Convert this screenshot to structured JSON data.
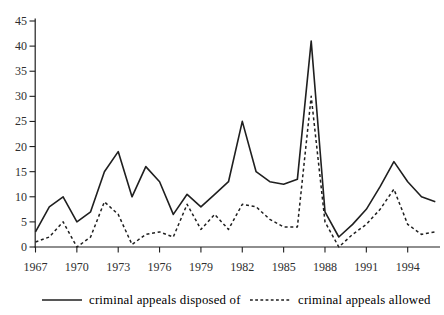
{
  "figure": {
    "background": "#ffffff",
    "ink_color": "#1f1f1f",
    "text_color": "#2e2e2e"
  },
  "chart_data": {
    "type": "line",
    "title": "",
    "xlabel": "",
    "ylabel": "",
    "x": [
      1967,
      1968,
      1969,
      1970,
      1971,
      1972,
      1973,
      1974,
      1975,
      1976,
      1977,
      1978,
      1979,
      1980,
      1981,
      1982,
      1983,
      1984,
      1985,
      1986,
      1987,
      1988,
      1989,
      1990,
      1991,
      1992,
      1993,
      1994,
      1995,
      1996
    ],
    "series": [
      {
        "name": "criminal appeals disposed of",
        "style": "solid",
        "values": [
          3,
          8,
          10,
          5,
          7,
          15,
          19,
          10,
          16,
          13,
          6.5,
          10.5,
          8,
          10.5,
          13,
          25,
          15,
          13,
          12.5,
          13.5,
          41,
          7,
          2,
          4.5,
          7.5,
          12,
          17,
          13,
          10,
          9
        ]
      },
      {
        "name": "criminal appeals allowed",
        "style": "dashed",
        "values": [
          1,
          2,
          5,
          0,
          2,
          9,
          6.5,
          0.5,
          2.5,
          3,
          2,
          8.5,
          3.5,
          6.5,
          3.5,
          8.5,
          8,
          5.5,
          4,
          4,
          30,
          5,
          0,
          2.5,
          4.5,
          7.5,
          11.5,
          4.5,
          2.5,
          3
        ]
      }
    ],
    "xlim": [
      1967,
      1996
    ],
    "ylim": [
      0,
      45
    ],
    "x_ticks": [
      1967,
      1970,
      1973,
      1976,
      1979,
      1982,
      1985,
      1988,
      1991,
      1994
    ],
    "y_ticks": [
      0,
      5,
      10,
      15,
      20,
      25,
      30,
      35,
      40,
      45
    ],
    "grid": false,
    "legend_position": "bottom"
  },
  "legend": {
    "items": [
      {
        "label": "criminal appeals disposed of",
        "line_style": "solid"
      },
      {
        "label": "criminal appeals allowed",
        "line_style": "dashed"
      }
    ]
  }
}
